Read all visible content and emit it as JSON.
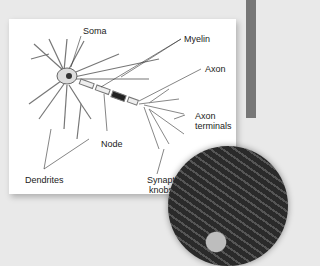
{
  "figure": {
    "labels": {
      "soma": "Soma",
      "myelin": "Myelin",
      "axon": "Axon",
      "axon_terminals_line1": "Axon",
      "axon_terminals_line2": "terminals",
      "node": "Node",
      "dendrites": "Dendrites",
      "synaptic_knobs_line1": "Synaptic",
      "synaptic_knobs_line2": "knobs"
    },
    "inset": {
      "description": "electron micrograph of neurons",
      "shape": "circle"
    },
    "colors": {
      "background": "#e9e9e9",
      "card": "#ffffff",
      "text": "#222222",
      "micrograph": "#333333"
    }
  }
}
